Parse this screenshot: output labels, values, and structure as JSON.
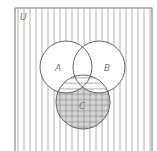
{
  "diagram": {
    "type": "venn",
    "universe_label": "U",
    "sets": [
      {
        "id": "A",
        "label": "A"
      },
      {
        "id": "B",
        "label": "B"
      },
      {
        "id": "C",
        "label": "C"
      }
    ],
    "shading": {
      "outside_all": "vertical-lines",
      "C_and_(A_or_B)": "horizontal-lines",
      "C_not_A_not_B": "gray-grid"
    },
    "colors": {
      "outline": "#555555",
      "hatch": "#9a9a9a",
      "grid_fill": "#d4d4d4",
      "background": "#ffffff"
    }
  }
}
